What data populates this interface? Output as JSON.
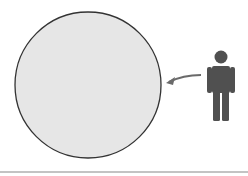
{
  "diagram": {
    "colors": {
      "circle_fill": "#e6e6e6",
      "circle_stroke": "#333333",
      "person": "#505050",
      "arrow": "#6a6a6a",
      "baseline": "#888888"
    },
    "icons": [
      "person-icon",
      "curved-arrow-icon"
    ]
  }
}
